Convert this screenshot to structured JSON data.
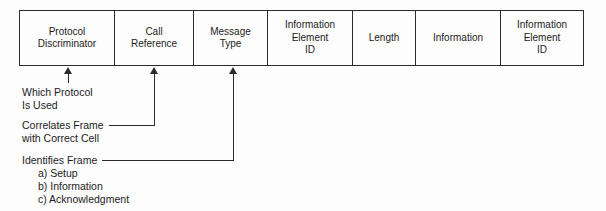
{
  "frame": {
    "fields": [
      {
        "label": "Protocol\nDiscriminator"
      },
      {
        "label": "Call\nReference"
      },
      {
        "label": "Message\nType"
      },
      {
        "label": "Information\nElement\nID"
      },
      {
        "label": "Length"
      },
      {
        "label": "Information"
      },
      {
        "label": "Information\nElement\nID"
      }
    ]
  },
  "annotations": {
    "which_protocol": "Which Protocol\nIs Used",
    "correlates": "Correlates Frame\nwith Correct Cell",
    "identifies": "Identifies Frame",
    "identifies_items": [
      "a) Setup",
      "b) Information",
      "c) Acknowledgment"
    ]
  },
  "colors": {
    "line": "#2b2b2b",
    "text": "#1c1c1c",
    "background": "#fdfdfd"
  }
}
